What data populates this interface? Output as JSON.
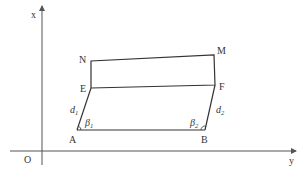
{
  "diagram": {
    "axes": {
      "vertical_label": "x",
      "horizontal_label": "y",
      "origin_label": "O"
    },
    "points": {
      "A": "A",
      "B": "B",
      "E": "E",
      "F": "F",
      "N": "N",
      "M": "M"
    },
    "segment_labels": {
      "d1": {
        "main": "d",
        "sub": "1"
      },
      "d2": {
        "main": "d",
        "sub": "2"
      }
    },
    "angle_labels": {
      "beta1": {
        "main": "β",
        "sub": "1"
      },
      "beta2": {
        "main": "β",
        "sub": "2"
      }
    },
    "colors": {
      "line": "#333333",
      "axis": "#555555",
      "background": "#ffffff"
    }
  }
}
